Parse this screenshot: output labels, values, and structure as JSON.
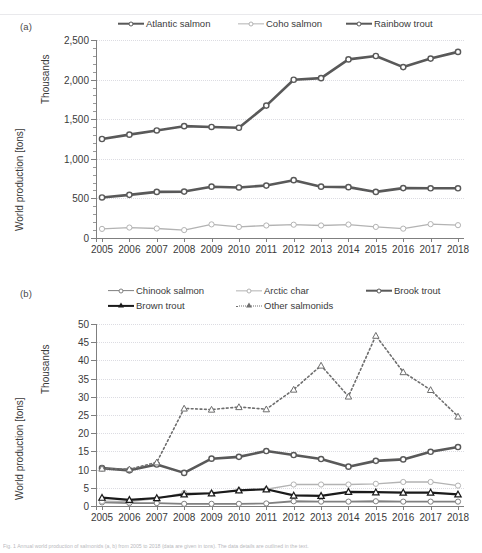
{
  "figure": {
    "panel_a_label": "(a)",
    "panel_b_label": "(b)",
    "caption": "Fig. 1  Annual world production of salmonids (a, b) from 2005 to 2018 (data are given in tons). The data details are outlined in the text."
  },
  "colors": {
    "dark_gray": "#595959",
    "mid_gray": "#808080",
    "light_gray": "#b3b3b3",
    "black": "#1a1a1a",
    "dotted_gray": "#6e6e6e",
    "axis": "#7f7f7f",
    "grid": "#dcdce2",
    "text": "#3a3a3a"
  },
  "panel_a": {
    "label": "(a)",
    "y_axis_title": "World production [tons]",
    "y_axis_units": "Thousands",
    "legend": [
      {
        "label": "Atlantic salmon",
        "color": "#595959",
        "width": 2.6,
        "dash": "none",
        "marker": "circle"
      },
      {
        "label": "Coho salmon",
        "color": "#b3b3b3",
        "width": 1.3,
        "dash": "none",
        "marker": "circle"
      },
      {
        "label": "Rainbow trout",
        "color": "#595959",
        "width": 2.6,
        "dash": "none",
        "marker": "circle"
      }
    ]
  },
  "panel_b": {
    "label": "(b)",
    "y_axis_title": "World production [tons]",
    "y_axis_units": "Thousands",
    "legend": [
      {
        "label": "Chinook salmon",
        "color": "#808080",
        "width": 1.8,
        "dash": "none",
        "marker": "circle"
      },
      {
        "label": "Arctic char",
        "color": "#b3b3b3",
        "width": 1.3,
        "dash": "none",
        "marker": "circle"
      },
      {
        "label": "Brook trout",
        "color": "#595959",
        "width": 2.6,
        "dash": "none",
        "marker": "circle"
      },
      {
        "label": "Brown trout",
        "color": "#1a1a1a",
        "width": 2.2,
        "dash": "none",
        "marker": "triangle"
      },
      {
        "label": "Other salmonids",
        "color": "#6e6e6e",
        "width": 1.6,
        "dash": "dotted",
        "marker": "triangle"
      }
    ]
  },
  "chart_data": [
    {
      "id": "panel_a",
      "type": "line",
      "title": "(a)",
      "xlabel": "",
      "ylabel": "World production [tons]",
      "yunits": "Thousands",
      "grid": true,
      "legend_position": "top",
      "x": [
        2005,
        2006,
        2007,
        2008,
        2009,
        2010,
        2011,
        2012,
        2013,
        2014,
        2015,
        2016,
        2017,
        2018
      ],
      "categories": [
        "2005",
        "2006",
        "2007",
        "2008",
        "2009",
        "2010",
        "2011",
        "2012",
        "2013",
        "2014",
        "2015",
        "2016",
        "2017",
        "2018"
      ],
      "ylim": [
        0,
        2500
      ],
      "yticks": [
        0,
        500,
        1000,
        1500,
        2000,
        2500
      ],
      "ytick_labels": [
        "0",
        "500",
        "1,000",
        "1,500",
        "2,000",
        "2,500"
      ],
      "series": [
        {
          "name": "Atlantic salmon",
          "color": "#595959",
          "marker": "circle",
          "values": [
            1250,
            1305,
            1358,
            1412,
            1402,
            1392,
            1672,
            1998,
            2018,
            2255,
            2298,
            2158,
            2265,
            2350
          ]
        },
        {
          "name": "Coho salmon",
          "color": "#b3b3b3",
          "marker": "circle",
          "values": [
            115,
            132,
            120,
            100,
            172,
            140,
            158,
            168,
            158,
            170,
            140,
            118,
            175,
            162
          ]
        },
        {
          "name": "Rainbow trout",
          "color": "#595959",
          "marker": "circle",
          "values": [
            512,
            545,
            582,
            586,
            648,
            638,
            662,
            730,
            648,
            642,
            582,
            630,
            628,
            628
          ]
        }
      ]
    },
    {
      "id": "panel_b",
      "type": "line",
      "title": "(b)",
      "xlabel": "",
      "ylabel": "World production [tons]",
      "yunits": "Thousands",
      "grid": true,
      "legend_position": "top",
      "x": [
        2005,
        2006,
        2007,
        2008,
        2009,
        2010,
        2011,
        2012,
        2013,
        2014,
        2015,
        2016,
        2017,
        2018
      ],
      "categories": [
        "2005",
        "2006",
        "2007",
        "2008",
        "2009",
        "2010",
        "2011",
        "2012",
        "2013",
        "2014",
        "2015",
        "2016",
        "2017",
        "2018"
      ],
      "ylim": [
        0,
        50
      ],
      "yticks": [
        0,
        5,
        10,
        15,
        20,
        25,
        30,
        35,
        40,
        45,
        50
      ],
      "ytick_labels": [
        "0",
        "5",
        "10",
        "15",
        "20",
        "25",
        "30",
        "35",
        "40",
        "45",
        "50"
      ],
      "series": [
        {
          "name": "Chinook salmon",
          "color": "#808080",
          "marker": "circle",
          "values": [
            1.0,
            0.8,
            0.8,
            0.6,
            0.6,
            0.6,
            0.7,
            1.3,
            1.2,
            1.2,
            1.3,
            1.2,
            1.2,
            1.2
          ]
        },
        {
          "name": "Arctic char",
          "color": "#b3b3b3",
          "marker": "circle",
          "values": [
            1.3,
            1.2,
            2.0,
            3.6,
            3.5,
            4.3,
            4.6,
            5.9,
            5.9,
            5.9,
            6.1,
            6.6,
            6.6,
            5.6
          ]
        },
        {
          "name": "Brook trout",
          "color": "#595959",
          "marker": "circle",
          "values": [
            10.4,
            9.8,
            11.4,
            9.1,
            13.0,
            13.5,
            15.1,
            14.0,
            12.9,
            10.8,
            12.4,
            12.8,
            14.9,
            16.2
          ]
        },
        {
          "name": "Brown trout",
          "color": "#1a1a1a",
          "marker": "triangle",
          "values": [
            2.3,
            1.7,
            2.2,
            3.2,
            3.5,
            4.3,
            4.6,
            2.9,
            2.8,
            3.9,
            3.8,
            3.7,
            3.7,
            3.2
          ]
        },
        {
          "name": "Other salmonids",
          "color": "#6e6e6e",
          "marker": "triangle",
          "dash": "dotted",
          "values": [
            10.3,
            10.1,
            12.0,
            26.8,
            26.5,
            27.2,
            26.6,
            32.0,
            38.6,
            30.1,
            46.8,
            36.8,
            31.9,
            24.6
          ]
        }
      ]
    }
  ]
}
